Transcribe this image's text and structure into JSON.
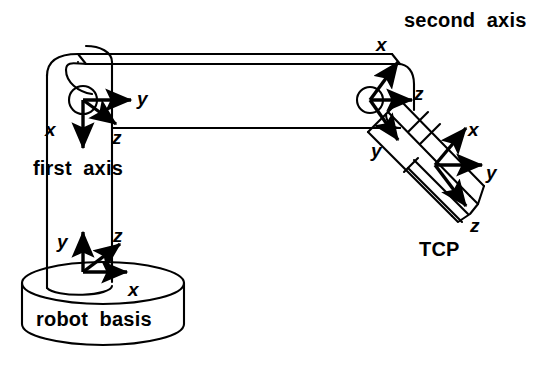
{
  "figure": {
    "background_color": "#ffffff",
    "line_color": "#000000",
    "width": 557,
    "height": 365
  },
  "captions": {
    "first_axis": "first  axis",
    "second_axis": "second  axis",
    "robot_basis": "robot  basis",
    "tcp": "TCP"
  },
  "frames": {
    "base": {
      "name": "robot basis",
      "x_label": "x",
      "y_label": "y",
      "z_label": "z",
      "origin": {
        "x": 83,
        "y": 272
      },
      "axes": [
        {
          "axis": "y",
          "direction": "up"
        },
        {
          "axis": "z",
          "direction": "up-right"
        },
        {
          "axis": "x",
          "direction": "right"
        }
      ]
    },
    "first_axis": {
      "name": "first axis",
      "x_label": "x",
      "y_label": "y",
      "z_label": "z",
      "origin": {
        "x": 83,
        "y": 100
      },
      "axes": [
        {
          "axis": "y",
          "direction": "right"
        },
        {
          "axis": "z",
          "direction": "down-right"
        },
        {
          "axis": "x",
          "direction": "down"
        }
      ]
    },
    "second_axis": {
      "name": "second axis",
      "x_label": "x",
      "y_label": "y",
      "z_label": "z",
      "origin": {
        "x": 370,
        "y": 100
      },
      "axes": [
        {
          "axis": "x",
          "direction": "up"
        },
        {
          "axis": "z",
          "direction": "right"
        },
        {
          "axis": "y",
          "direction": "down-left"
        }
      ]
    },
    "tcp": {
      "name": "TCP",
      "x_label": "x",
      "y_label": "y",
      "z_label": "z",
      "origin": {
        "x": 435,
        "y": 165
      },
      "axes": [
        {
          "axis": "x",
          "direction": "up-right"
        },
        {
          "axis": "y",
          "direction": "right"
        },
        {
          "axis": "z",
          "direction": "down-right"
        }
      ]
    }
  },
  "parts": {
    "base_cylinder": "robot base cylinder",
    "vertical_column": "vertical column link",
    "horizontal_arm": "horizontal arm link",
    "gripper": "tool / gripper body"
  }
}
